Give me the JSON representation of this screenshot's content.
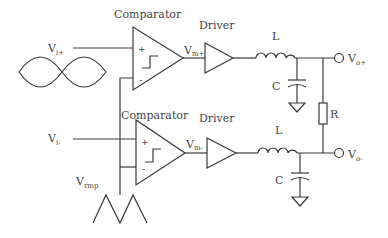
{
  "diagram": {
    "type": "circuit-schematic",
    "colors": {
      "line": "#3a3a3a",
      "text": "#444444",
      "background": "#ffffff"
    }
  },
  "labels": {
    "comparator_top": "Comparator",
    "comparator_bottom": "Comparator",
    "driver_top": "Driver",
    "driver_bottom": "Driver",
    "inductor_top": "L",
    "inductor_bottom": "L",
    "capacitor_top": "C",
    "capacitor_bottom": "C",
    "resistor": "R",
    "plus_sign": "+",
    "minus_sign": "-"
  },
  "signals": {
    "vi_plus": {
      "base": "V",
      "sub": "i+"
    },
    "vi_minus": {
      "base": "V",
      "sub": "i-"
    },
    "vm_plus": {
      "base": "V",
      "sub": "m+"
    },
    "vm_minus": {
      "base": "V",
      "sub": "m-"
    },
    "vo_plus": {
      "base": "V",
      "sub": "o+"
    },
    "vo_minus": {
      "base": "V",
      "sub": "o-"
    },
    "vramp": {
      "base": "V",
      "sub": "rmp"
    }
  },
  "icons": {
    "input_waveform": "sine-lobes-icon",
    "ramp_waveform": "triangle-wave-icon",
    "comparator_symbol": "hysteresis-step-icon",
    "ground": "ground-icon",
    "output_terminal": "terminal-circle-icon"
  }
}
